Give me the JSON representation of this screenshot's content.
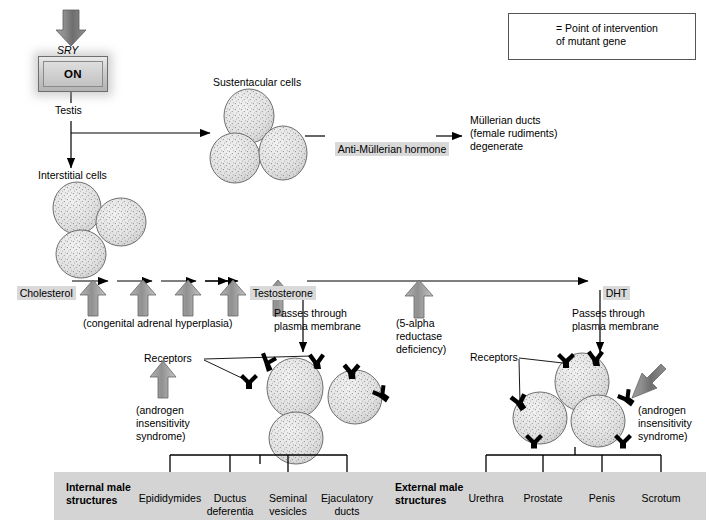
{
  "diagram": {
    "legend": {
      "icon": "up-arrow-icon",
      "line1": "= Point of intervention",
      "line2": "of mutant gene"
    },
    "gene": {
      "name": "SRY",
      "state": "ON",
      "output": "Testis"
    },
    "cells": {
      "sustentacular_label": "Sustentacular cells",
      "interstitial_label": "Interstitial cells",
      "receptors_label_left": "Receptors",
      "receptors_label_right": "Receptors"
    },
    "amh": {
      "hormone": "Anti-Müllerian hormone",
      "effect_line1": "Müllerian ducts",
      "effect_line2": "(female rudiments)",
      "effect_line3": "degenerate"
    },
    "pathway": {
      "start": "Cholesterol",
      "middle": "Testosterone",
      "end": "DHT",
      "steps": 5,
      "cah_label": "(congenital adrenal hyperplasia)",
      "reductase_line1": "(5-alpha",
      "reductase_line2": "reductase",
      "reductase_line3": "deficiency)",
      "passes_left_line1": "Passes through",
      "passes_left_line2": "plasma membrane",
      "passes_right_line1": "Passes through",
      "passes_right_line2": "plasma membrane"
    },
    "ais_left": {
      "line1": "(androgen",
      "line2": "insensitivity",
      "line3": "syndrome)"
    },
    "ais_right": {
      "line1": "(androgen",
      "line2": "insensitivity",
      "line3": "syndrome)"
    },
    "internal": {
      "heading_line1": "Internal male",
      "heading_line2": "structures",
      "items": [
        "Epididymides",
        "Ductus\ndeferentia",
        "Seminal\nvesicles",
        "Ejaculatory\nducts"
      ]
    },
    "external": {
      "heading_line1": "External male",
      "heading_line2": "structures",
      "items": [
        "Urethra",
        "Prostate",
        "Penis",
        "Scrotum"
      ]
    },
    "colors": {
      "intervention_arrow": "#7a7a7a",
      "highlight": "#d9d9d9",
      "bottom_bar": "#d4d4d4",
      "cell_fill": "#e4e4e4",
      "line": "#000000"
    }
  }
}
